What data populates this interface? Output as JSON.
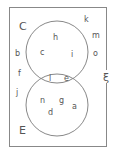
{
  "diagram": {
    "type": "venn",
    "universal_symbol": "ξ",
    "sets": [
      {
        "name": "C",
        "label": "C",
        "elements": [
          "h",
          "c",
          "i",
          "l",
          "e"
        ]
      },
      {
        "name": "E",
        "label": "E",
        "elements": [
          "l",
          "e",
          "n",
          "g",
          "a",
          "d"
        ]
      }
    ],
    "regions": {
      "c_only": [
        "h",
        "c",
        "i"
      ],
      "intersection": [
        "l",
        "e"
      ],
      "e_only": [
        "n",
        "g",
        "a",
        "d"
      ],
      "outside": [
        "k",
        "m",
        "o",
        "b",
        "f",
        "j"
      ]
    },
    "labels": {
      "C": "C",
      "E": "E",
      "xi": "ξ",
      "h": "h",
      "c": "c",
      "i": "i",
      "l": "l",
      "e": "e",
      "n": "n",
      "g": "g",
      "a": "a",
      "d": "d",
      "k": "k",
      "m": "m",
      "o": "o",
      "b": "b",
      "f": "f",
      "j": "j"
    },
    "colors": {
      "stroke": "#888888",
      "text": "#555555",
      "background": "#ffffff"
    }
  }
}
